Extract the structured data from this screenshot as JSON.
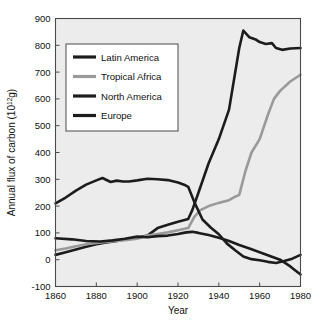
{
  "chart_data": {
    "type": "line",
    "title": "",
    "xlabel": "Year",
    "ylabel": "Annual flux of carbon (10",
    "ylabel_exp": "12",
    "ylabel_tail": "g)",
    "xlim": [
      1860,
      1980
    ],
    "ylim": [
      -100,
      900
    ],
    "grid": false,
    "legend_position": "upper left",
    "xticks": [
      1860,
      1880,
      1900,
      1920,
      1940,
      1960,
      1980
    ],
    "xtick_labels": [
      "1860",
      "1880",
      "1900",
      "1920",
      "1940",
      "1960",
      "1980"
    ],
    "yticks": [
      -100,
      0,
      100,
      200,
      300,
      400,
      500,
      600,
      700,
      800,
      900
    ],
    "ytick_labels": [
      "-100",
      "0",
      "100",
      "200",
      "300",
      "400",
      "500",
      "600",
      "700",
      "800",
      "900"
    ],
    "series": [
      {
        "name": "Latin America",
        "color": "#1c1c1c",
        "width": 2.6,
        "x": [
          1860,
          1865,
          1870,
          1875,
          1880,
          1885,
          1890,
          1895,
          1900,
          1905,
          1910,
          1915,
          1920,
          1925,
          1927,
          1930,
          1935,
          1940,
          1945,
          1950,
          1952,
          1955,
          1958,
          1960,
          1963,
          1966,
          1968,
          1971,
          1975,
          1980
        ],
        "y": [
          18,
          28,
          38,
          48,
          58,
          64,
          70,
          78,
          82,
          90,
          118,
          130,
          142,
          152,
          185,
          250,
          360,
          450,
          560,
          790,
          855,
          830,
          822,
          812,
          805,
          808,
          790,
          783,
          788,
          790
        ]
      },
      {
        "name": "Tropical Africa",
        "color": "#9a9a9a",
        "width": 2.6,
        "x": [
          1860,
          1865,
          1870,
          1875,
          1880,
          1885,
          1890,
          1895,
          1900,
          1905,
          1910,
          1915,
          1920,
          1925,
          1928,
          1931,
          1935,
          1940,
          1945,
          1948,
          1950,
          1953,
          1956,
          1960,
          1964,
          1967,
          1970,
          1975,
          1980
        ],
        "y": [
          35,
          42,
          50,
          58,
          62,
          66,
          70,
          74,
          78,
          90,
          96,
          102,
          110,
          118,
          160,
          185,
          200,
          212,
          222,
          235,
          242,
          330,
          400,
          450,
          540,
          600,
          630,
          665,
          690
        ]
      },
      {
        "name": "North America",
        "color": "#1c1c1c",
        "width": 2.6,
        "x": [
          1860,
          1865,
          1870,
          1875,
          1880,
          1883,
          1887,
          1890,
          1893,
          1896,
          1900,
          1905,
          1910,
          1915,
          1920,
          1923,
          1925,
          1928,
          1932,
          1936,
          1940,
          1944,
          1948,
          1952,
          1956,
          1960,
          1964,
          1968,
          1972,
          1976,
          1980
        ],
        "y": [
          210,
          232,
          258,
          280,
          296,
          305,
          290,
          295,
          292,
          292,
          296,
          302,
          300,
          297,
          288,
          280,
          272,
          215,
          150,
          120,
          95,
          60,
          35,
          12,
          2,
          -2,
          -8,
          -12,
          -5,
          4,
          18
        ]
      },
      {
        "name": "Europe",
        "color": "#1c1c1c",
        "width": 2.6,
        "x": [
          1860,
          1868,
          1875,
          1882,
          1888,
          1894,
          1900,
          1905,
          1910,
          1915,
          1920,
          1924,
          1927,
          1930,
          1935,
          1940,
          1945,
          1950,
          1955,
          1960,
          1965,
          1970,
          1975,
          1980
        ],
        "y": [
          80,
          76,
          70,
          68,
          72,
          78,
          86,
          84,
          88,
          90,
          96,
          102,
          104,
          100,
          92,
          82,
          70,
          55,
          42,
          28,
          14,
          0,
          -25,
          -55
        ]
      }
    ],
    "legend_entries": [
      {
        "label": "Latin America",
        "color": "#1c1c1c"
      },
      {
        "label": "Tropical Africa",
        "color": "#9a9a9a"
      },
      {
        "label": "North America",
        "color": "#1c1c1c"
      },
      {
        "label": "Europe",
        "color": "#1c1c1c"
      }
    ]
  }
}
